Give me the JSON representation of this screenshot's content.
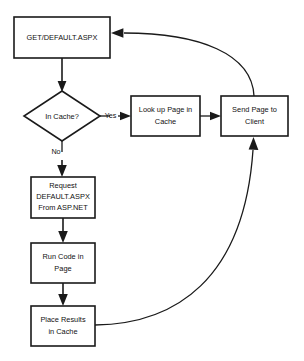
{
  "diagram": {
    "type": "flowchart",
    "title": "",
    "background_color": "#ffffff",
    "line_color": "#1a1a1a",
    "text_color": "#111111",
    "nodes": [
      {
        "id": "get-request",
        "shape": "rectangle",
        "lines": [
          "GET/DEFAULT.ASPX"
        ],
        "x": 14,
        "y": 17,
        "w": 96,
        "h": 41
      },
      {
        "id": "in-cache-decision",
        "shape": "diamond",
        "lines": [
          "In Cache?"
        ],
        "cx": 62,
        "cy": 116,
        "rx": 38,
        "ry": 25
      },
      {
        "id": "look-up-page",
        "shape": "rectangle",
        "lines": [
          "Look up Page in",
          "Cache"
        ],
        "x": 131,
        "y": 96,
        "w": 69,
        "h": 40
      },
      {
        "id": "send-page",
        "shape": "rectangle",
        "lines": [
          "Send Page to",
          "Client"
        ],
        "x": 221,
        "y": 96,
        "w": 67,
        "h": 40
      },
      {
        "id": "request-aspnet",
        "shape": "rectangle",
        "lines": [
          "Request",
          "DEFAULT.ASPX",
          "From ASP.NET"
        ],
        "x": 31,
        "y": 177,
        "w": 64,
        "h": 41
      },
      {
        "id": "run-code",
        "shape": "rectangle",
        "lines": [
          "Run Code in",
          "Page"
        ],
        "x": 31,
        "y": 243,
        "w": 64,
        "h": 40
      },
      {
        "id": "place-results",
        "shape": "rectangle",
        "lines": [
          "Place Results",
          "in Cache"
        ],
        "x": 31,
        "y": 306,
        "w": 64,
        "h": 40
      }
    ],
    "edges": [
      {
        "id": "e1",
        "from": "get-request",
        "to": "in-cache-decision",
        "label": "",
        "style": "straight"
      },
      {
        "id": "e2",
        "from": "in-cache-decision",
        "to": "look-up-page",
        "label": "Yes",
        "style": "straight"
      },
      {
        "id": "e3",
        "from": "in-cache-decision",
        "to": "request-aspnet",
        "label": "No",
        "style": "straight"
      },
      {
        "id": "e4",
        "from": "look-up-page",
        "to": "send-page",
        "label": "",
        "style": "straight"
      },
      {
        "id": "e5",
        "from": "request-aspnet",
        "to": "run-code",
        "label": "",
        "style": "straight"
      },
      {
        "id": "e6",
        "from": "run-code",
        "to": "place-results",
        "label": "",
        "style": "straight"
      },
      {
        "id": "e7",
        "from": "place-results",
        "to": "send-page",
        "label": "",
        "style": "curved"
      },
      {
        "id": "e8",
        "from": "send-page",
        "to": "get-request",
        "label": "",
        "style": "curved"
      }
    ],
    "edge_labels": {
      "yes": "Yes",
      "no": "No"
    }
  }
}
